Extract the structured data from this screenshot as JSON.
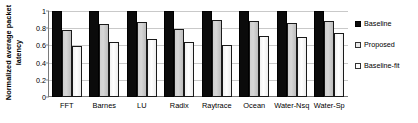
{
  "chart_data": {
    "type": "bar",
    "title": "",
    "xlabel": "",
    "ylabel": "Normalized average packet latency",
    "ylabel_line1": "Normalized average packet",
    "ylabel_line2": "latency",
    "ylim": [
      0,
      1
    ],
    "ytick_labels": [
      "1",
      "0.8",
      "0.6",
      "0.4",
      "0.2",
      "0"
    ],
    "ytick_values": [
      1,
      0.8,
      0.6,
      0.4,
      0.2,
      0
    ],
    "grid": true,
    "legend_position": "right",
    "categories": [
      "FFT",
      "Barnes",
      "LU",
      "Radix",
      "Raytrace",
      "Ocean",
      "Water-Nsq",
      "Water-Sp"
    ],
    "series": [
      {
        "name": "Baseline",
        "color": "#0b0b0b",
        "values": [
          1.0,
          1.0,
          1.0,
          1.0,
          1.0,
          1.0,
          1.0,
          1.0
        ]
      },
      {
        "name": "Proposed",
        "color": "#cfcfcf",
        "values": [
          0.78,
          0.85,
          0.87,
          0.79,
          0.9,
          0.88,
          0.86,
          0.88
        ]
      },
      {
        "name": "Baseline-fit",
        "color": "#f7f7f7",
        "values": [
          0.59,
          0.64,
          0.67,
          0.64,
          0.61,
          0.71,
          0.7,
          0.74
        ]
      }
    ]
  }
}
